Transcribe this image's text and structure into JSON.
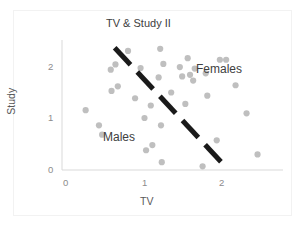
{
  "chart_data": {
    "type": "scatter",
    "title": "TV & Study II",
    "xlabel": "TV",
    "ylabel": "Study",
    "xlim": [
      0,
      2.55
    ],
    "ylim": [
      0,
      2.45
    ],
    "xticks": [
      "0",
      "1",
      "2"
    ],
    "yticks": [
      "0",
      "1",
      "2"
    ],
    "xtick_values": [
      0,
      1,
      2
    ],
    "ytick_values": [
      0,
      1,
      2
    ],
    "grid": false,
    "legend": "none",
    "marker_color": "#bfbfbf",
    "divider_color": "#1a1a1a",
    "axis_color": "#d9d9d9",
    "annotations": [
      {
        "text": "Females",
        "x": 1.72,
        "y": 1.95
      },
      {
        "text": "Males",
        "x": 0.52,
        "y": 0.63
      }
    ],
    "divider_line": {
      "style": "dashed",
      "width": 5,
      "x_start": 0.62,
      "y_start": 2.35,
      "x_end": 2.06,
      "y_end": 0.02
    },
    "points": [
      {
        "x": 0.25,
        "y": 1.15
      },
      {
        "x": 0.42,
        "y": 0.86
      },
      {
        "x": 0.46,
        "y": 0.68
      },
      {
        "x": 0.57,
        "y": 1.93
      },
      {
        "x": 0.58,
        "y": 1.52
      },
      {
        "x": 0.63,
        "y": 2.03
      },
      {
        "x": 0.66,
        "y": 1.61
      },
      {
        "x": 0.79,
        "y": 2.29
      },
      {
        "x": 0.88,
        "y": 1.38
      },
      {
        "x": 0.95,
        "y": 1.96
      },
      {
        "x": 1.0,
        "y": 1.0
      },
      {
        "x": 1.02,
        "y": 0.38
      },
      {
        "x": 1.08,
        "y": 1.24
      },
      {
        "x": 1.1,
        "y": 0.48
      },
      {
        "x": 1.18,
        "y": 1.78
      },
      {
        "x": 1.2,
        "y": 2.33
      },
      {
        "x": 1.21,
        "y": 0.86
      },
      {
        "x": 1.22,
        "y": 0.15
      },
      {
        "x": 1.24,
        "y": 2.04
      },
      {
        "x": 1.34,
        "y": 1.49
      },
      {
        "x": 1.45,
        "y": 1.98
      },
      {
        "x": 1.48,
        "y": 1.8
      },
      {
        "x": 1.52,
        "y": 1.27
      },
      {
        "x": 1.55,
        "y": 2.15
      },
      {
        "x": 1.58,
        "y": 1.83
      },
      {
        "x": 1.62,
        "y": 1.72
      },
      {
        "x": 1.64,
        "y": 1.95
      },
      {
        "x": 1.74,
        "y": 0.07
      },
      {
        "x": 1.78,
        "y": 1.86
      },
      {
        "x": 1.8,
        "y": 1.43
      },
      {
        "x": 1.96,
        "y": 2.12
      },
      {
        "x": 2.04,
        "y": 2.12
      },
      {
        "x": 1.92,
        "y": 0.57
      },
      {
        "x": 2.16,
        "y": 1.63
      },
      {
        "x": 2.3,
        "y": 1.09
      },
      {
        "x": 2.44,
        "y": 0.3
      }
    ]
  }
}
